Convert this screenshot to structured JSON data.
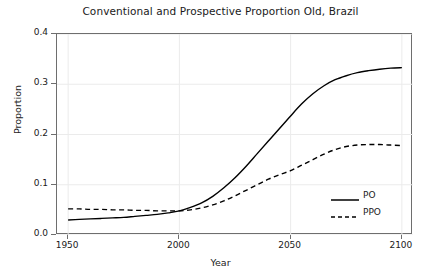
{
  "chart_data": {
    "type": "line",
    "title": "Conventional and Prospective Proportion Old, Brazil",
    "xlabel": "Year",
    "ylabel": "Proportion",
    "xlim": [
      1945,
      2105
    ],
    "ylim": [
      0.0,
      0.4
    ],
    "xticks": [
      1950,
      2000,
      2050,
      2100
    ],
    "xtick_labels": [
      "1950",
      "2000",
      "2050",
      "2100"
    ],
    "yticks": [
      0.0,
      0.1,
      0.2,
      0.3,
      0.4
    ],
    "ytick_labels": [
      "0.0",
      "0.1",
      "0.2",
      "0.3",
      "0.4"
    ],
    "grid": true,
    "grid_color": "#ebebeb",
    "axis_color": "#6e6e6e",
    "line_color": "#000000",
    "legend_position": "bottom-right",
    "x": [
      1950,
      1955,
      1960,
      1965,
      1970,
      1975,
      1980,
      1985,
      1990,
      1995,
      2000,
      2005,
      2010,
      2015,
      2020,
      2025,
      2030,
      2035,
      2040,
      2045,
      2050,
      2055,
      2060,
      2065,
      2070,
      2075,
      2080,
      2085,
      2090,
      2095,
      2100
    ],
    "series": [
      {
        "name": "PO",
        "style": "solid",
        "values": [
          0.03,
          0.031,
          0.032,
          0.033,
          0.034,
          0.035,
          0.037,
          0.039,
          0.041,
          0.044,
          0.048,
          0.055,
          0.064,
          0.077,
          0.094,
          0.114,
          0.137,
          0.162,
          0.187,
          0.212,
          0.237,
          0.261,
          0.281,
          0.297,
          0.309,
          0.317,
          0.323,
          0.327,
          0.33,
          0.332,
          0.333
        ]
      },
      {
        "name": "PPO",
        "style": "dashed",
        "values": [
          0.052,
          0.052,
          0.051,
          0.051,
          0.05,
          0.05,
          0.049,
          0.049,
          0.048,
          0.048,
          0.048,
          0.05,
          0.054,
          0.06,
          0.068,
          0.078,
          0.089,
          0.1,
          0.111,
          0.12,
          0.128,
          0.139,
          0.15,
          0.161,
          0.17,
          0.176,
          0.179,
          0.18,
          0.18,
          0.179,
          0.178
        ]
      }
    ]
  }
}
